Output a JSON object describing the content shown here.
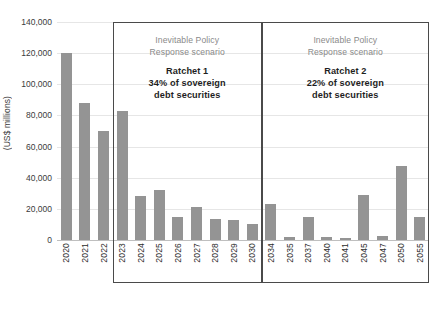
{
  "chart_data": {
    "type": "bar",
    "title": "",
    "xlabel": "",
    "ylabel": "(US$ millions)",
    "ylim": [
      0,
      140000
    ],
    "grid": true,
    "legend": "none",
    "y_ticks": [
      "0",
      "20,000",
      "40,000",
      "60,000",
      "80,000",
      "100,000",
      "120,000",
      "140,000"
    ],
    "y_tick_values": [
      0,
      20000,
      40000,
      60000,
      80000,
      100000,
      120000,
      140000
    ],
    "categories": [
      "2020",
      "2021",
      "2022",
      "2023",
      "2024",
      "2025",
      "2026",
      "2027",
      "2028",
      "2029",
      "2030",
      "2034",
      "2035",
      "2037",
      "2040",
      "2041",
      "2045",
      "2047",
      "2050",
      "2055"
    ],
    "values": [
      120000,
      88000,
      70000,
      83000,
      28000,
      32000,
      14500,
      21000,
      13500,
      13000,
      10000,
      23000,
      2000,
      14500,
      2000,
      1500,
      29000,
      2500,
      47500,
      14500
    ],
    "bar_color": "#949494",
    "annotations": [
      {
        "id": "ratchet-1",
        "heading_line_1": "Inevitable Policy",
        "heading_line_2": "Response scenario",
        "ratchet_label": "Ratchet 1",
        "detail_line_1": "34% of sovereign",
        "detail_line_2": "debt securities",
        "covers_categories": [
          "2023",
          "2024",
          "2025",
          "2026",
          "2027",
          "2028",
          "2029",
          "2030"
        ]
      },
      {
        "id": "ratchet-2",
        "heading_line_1": "Inevitable Policy",
        "heading_line_2": "Response scenario",
        "ratchet_label": "Ratchet 2",
        "detail_line_1": "22% of sovereign",
        "detail_line_2": "debt securities",
        "covers_categories": [
          "2034",
          "2035",
          "2037",
          "2040",
          "2041",
          "2045",
          "2047",
          "2050",
          "2055"
        ]
      }
    ]
  }
}
